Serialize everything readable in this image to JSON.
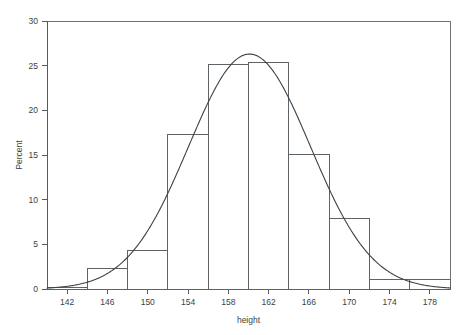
{
  "chart_data": {
    "type": "bar",
    "title": "",
    "subtitle": "",
    "xlabel": "height",
    "ylabel": "Percent",
    "xlim": [
      140,
      180
    ],
    "ylim": [
      0,
      30
    ],
    "xticks": [
      142,
      146,
      150,
      154,
      158,
      162,
      166,
      170,
      174,
      178
    ],
    "yticks": [
      0,
      5,
      10,
      15,
      20,
      25,
      30
    ],
    "grid": false,
    "legend": "none",
    "bin_width": 4,
    "bins": [
      {
        "label": "140-144",
        "start": 140,
        "end": 144,
        "midpoint": 142,
        "value": 0.2
      },
      {
        "label": "144-148",
        "start": 144,
        "end": 148,
        "midpoint": 146,
        "value": 2.3
      },
      {
        "label": "148-152",
        "start": 148,
        "end": 152,
        "midpoint": 150,
        "value": 4.3
      },
      {
        "label": "152-156",
        "start": 152,
        "end": 156,
        "midpoint": 154,
        "value": 17.3
      },
      {
        "label": "156-160",
        "start": 156,
        "end": 160,
        "midpoint": 158,
        "value": 25.1
      },
      {
        "label": "160-164",
        "start": 160,
        "end": 164,
        "midpoint": 162,
        "value": 25.3
      },
      {
        "label": "164-168",
        "start": 164,
        "end": 168,
        "midpoint": 166,
        "value": 15.1
      },
      {
        "label": "168-172",
        "start": 168,
        "end": 172,
        "midpoint": 170,
        "value": 7.9
      },
      {
        "label": "172-176",
        "start": 172,
        "end": 176,
        "midpoint": 174,
        "value": 1.1
      },
      {
        "label": "176-180",
        "start": 176,
        "end": 180,
        "midpoint": 178,
        "value": 1.1
      }
    ],
    "categories": [
      "140-144",
      "144-148",
      "148-152",
      "152-156",
      "156-160",
      "160-164",
      "164-168",
      "168-172",
      "172-176",
      "176-180"
    ],
    "values": [
      0.2,
      2.3,
      4.3,
      17.3,
      25.1,
      25.3,
      15.1,
      7.9,
      1.1,
      1.1
    ],
    "overlay_curve": {
      "name": "normal-density",
      "type": "line",
      "mean": 160.1,
      "std_dev": 6.05,
      "peak_x": 160.1,
      "peak_y": 26.3,
      "description": "fitted normal density curve scaled to percent"
    },
    "colors": {
      "bar_stroke": "#5e6367",
      "bar_fill": "none",
      "curve": "#3d4246",
      "axis": "#555a5e",
      "frame": "#6d7276",
      "text": "#3a3f43",
      "background": "#ffffff"
    }
  }
}
